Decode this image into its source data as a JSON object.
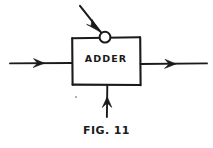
{
  "figure": {
    "background_color": "#ffffff",
    "ink_color": "#1a1a1a",
    "caption": "FIG. 11",
    "block": {
      "label": "ADDER",
      "shape": "rectangle",
      "x": 72,
      "y": 37,
      "width": 68,
      "height": 48
    },
    "node": {
      "name": "summing-junction-circle",
      "cx": 105,
      "cy": 37,
      "r": 5.5
    },
    "connections": [
      {
        "name": "left-input",
        "direction": "right",
        "from": [
          10,
          63
        ],
        "to": [
          72,
          63
        ],
        "arrowhead": "right",
        "arrowhead_at": [
          40,
          63
        ]
      },
      {
        "name": "right-output",
        "direction": "right",
        "from": [
          140,
          64
        ],
        "to": [
          207,
          64
        ],
        "arrowhead": "right",
        "arrowhead_at": [
          172,
          64
        ]
      },
      {
        "name": "bottom-input",
        "direction": "up",
        "from": [
          107,
          117
        ],
        "to": [
          107,
          85
        ],
        "arrowhead": "up",
        "arrowhead_at": [
          107,
          101
        ]
      },
      {
        "name": "diagonal-input",
        "direction": "down-right",
        "from": [
          80,
          6
        ],
        "to": [
          101,
          33
        ],
        "arrowhead": "down-right",
        "arrowhead_at": [
          95,
          25
        ]
      }
    ]
  }
}
